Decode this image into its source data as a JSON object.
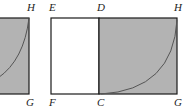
{
  "diagram": {
    "colors": {
      "shade": "#b3b3b3",
      "stroke": "#1a1a1a",
      "arc": "#555555"
    },
    "left_figure": {
      "labels": {
        "top_right": "H",
        "bottom_right": "G"
      }
    },
    "right_figure": {
      "labels": {
        "E": "E",
        "D": "D",
        "H": "H",
        "F": "F",
        "C": "C",
        "G": "G"
      }
    }
  }
}
